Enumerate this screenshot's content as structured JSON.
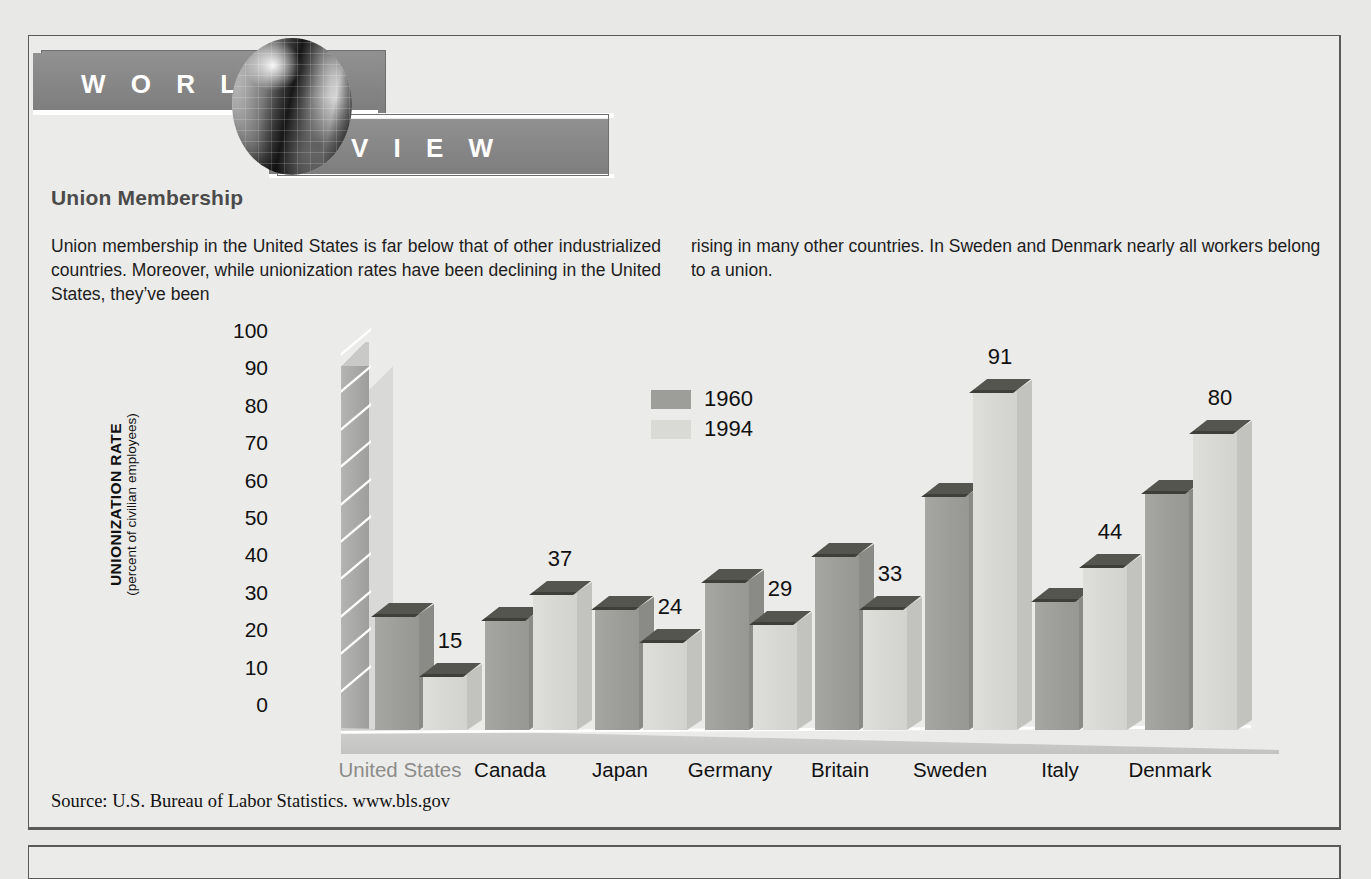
{
  "banner": {
    "word_world": "W O R L D",
    "word_view": "V I E W",
    "globe_icon": "globe-icon"
  },
  "article": {
    "title": "Union Membership",
    "paragraph_left": "Union membership in the United States is far below that of other industrialized countries. Moreover, while unionization rates have been declining in the United States, they’ve been",
    "paragraph_right": "rising in many other countries. In Sweden and Denmark nearly all workers belong to a union.",
    "source": "Source: U.S. Bureau of Labor Statistics. www.bls.gov"
  },
  "chart_data": {
    "type": "bar",
    "title": "Union Membership",
    "xlabel": "",
    "ylabel": "UNIONIZATION RATE",
    "ylabel_sub": "(percent of civilian employees)",
    "ylim": [
      0,
      100
    ],
    "yticks": [
      100,
      90,
      80,
      70,
      60,
      50,
      40,
      30,
      20,
      10,
      0
    ],
    "grid": false,
    "legend_position": "top-left-inside",
    "categories": [
      "United States",
      "Canada",
      "Japan",
      "Germany",
      "Britain",
      "Sweden",
      "Italy",
      "Denmark"
    ],
    "series": [
      {
        "name": "1960",
        "color": "#9d9d99",
        "values": [
          31,
          30,
          33,
          40,
          47,
          63,
          35,
          64
        ],
        "labels_shown": false
      },
      {
        "name": "1994",
        "color": "#d9dad6",
        "values": [
          15,
          37,
          24,
          29,
          33,
          91,
          44,
          80
        ],
        "labels_shown": true
      }
    ],
    "value_labels": [
      "15",
      "37",
      "24",
      "29",
      "33",
      "91",
      "44",
      "80"
    ]
  }
}
